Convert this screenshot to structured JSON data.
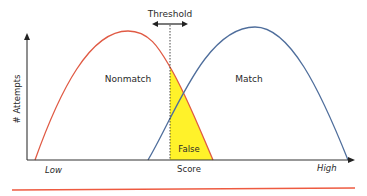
{
  "diagram": {
    "threshold_label": "Threshold",
    "y_axis_label": "# Attempts",
    "x_axis_label": "Score",
    "x_low_label": "Low",
    "x_high_label": "High",
    "nonmatch_label": "Nonmatch",
    "match_label": "Match",
    "overlap_label": "False",
    "colors": {
      "nonmatch_curve": "#e05a44",
      "match_curve": "#4f6e9c",
      "false_region": "#fff22a",
      "bottom_rule": "#ee5a40",
      "axes": "#222222"
    }
  }
}
